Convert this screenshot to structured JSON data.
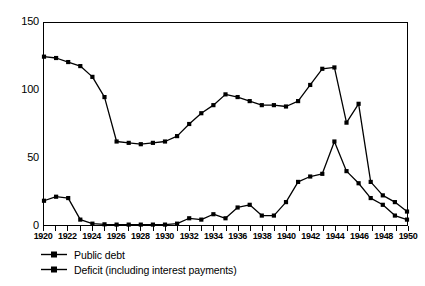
{
  "chart_data": {
    "type": "line",
    "title": "",
    "subtitle": "",
    "xlabel": "",
    "ylabel": "",
    "xlim": [
      1920,
      1950
    ],
    "ylim": [
      0,
      150
    ],
    "yticks": [
      0,
      50,
      100,
      150
    ],
    "ytick_labels": [
      "0",
      "50",
      "100",
      "150"
    ],
    "xticks": [
      1920,
      1921,
      1922,
      1923,
      1924,
      1925,
      1926,
      1927,
      1928,
      1929,
      1930,
      1931,
      1932,
      1933,
      1934,
      1935,
      1936,
      1937,
      1938,
      1939,
      1940,
      1941,
      1942,
      1943,
      1944,
      1945,
      1946,
      1947,
      1948,
      1949,
      1950
    ],
    "xtick_labels": [
      "1920",
      "1922",
      "1924",
      "1926",
      "1928",
      "1930",
      "1932",
      "1934",
      "1936",
      "1938",
      "1940",
      "1942",
      "1944",
      "1946",
      "1948",
      "1950"
    ],
    "xtick_label_values": [
      1920,
      1922,
      1924,
      1926,
      1928,
      1930,
      1932,
      1934,
      1936,
      1938,
      1940,
      1942,
      1944,
      1946,
      1948,
      1950
    ],
    "grid": false,
    "legend_position": "below-left",
    "x": [
      1920,
      1921,
      1922,
      1923,
      1924,
      1925,
      1926,
      1927,
      1928,
      1929,
      1930,
      1931,
      1932,
      1933,
      1934,
      1935,
      1936,
      1937,
      1938,
      1939,
      1940,
      1941,
      1942,
      1943,
      1944,
      1945,
      1946,
      1947,
      1948,
      1949,
      1950
    ],
    "series": [
      {
        "name": "Public debt",
        "marker": "square",
        "color": "#000000",
        "values": [
          125,
          124,
          121,
          118,
          110,
          95,
          62,
          61,
          60,
          61,
          62,
          66,
          75,
          83,
          89,
          97,
          95,
          92,
          89,
          89,
          88,
          92,
          104,
          116,
          117,
          76,
          90,
          32,
          22,
          18,
          15
        ]
      },
      {
        "name": "Deficit (including interest payments)",
        "marker": "square",
        "color": "#000000",
        "values": [
          18,
          21,
          20,
          4,
          1,
          0.5,
          0.3,
          0.3,
          0.3,
          0.3,
          0.3,
          1,
          5,
          4,
          8,
          5,
          13,
          15,
          7,
          7,
          17,
          32,
          36,
          38,
          62,
          40,
          31,
          28,
          29,
          30,
          30
        ]
      }
    ],
    "series_tail_note": {
      "public_debt_tail": [
        32,
        22,
        17,
        10,
        4
      ],
      "deficit_tail": [
        31,
        26,
        28,
        30,
        30
      ]
    },
    "public_debt_values_final": [
      125,
      124,
      121,
      118,
      110,
      95,
      62,
      61,
      60,
      61,
      62,
      66,
      75,
      83,
      89,
      97,
      95,
      92,
      89,
      89,
      88,
      92,
      104,
      116,
      117,
      76,
      90,
      32,
      22,
      17,
      10
    ],
    "deficit_values_final": [
      18,
      21,
      20,
      4,
      1,
      0.5,
      0.3,
      0.3,
      0.3,
      0.3,
      0.3,
      1,
      5,
      4,
      8,
      5,
      13,
      15,
      7,
      7,
      17,
      32,
      36,
      38,
      62,
      40,
      31,
      20,
      15,
      7,
      4
    ],
    "annotations": []
  },
  "legend": {
    "items": [
      {
        "label": "Public debt",
        "marker": "square-line"
      },
      {
        "label": "Deficit (including interest payments)",
        "marker": "square-line"
      }
    ]
  }
}
